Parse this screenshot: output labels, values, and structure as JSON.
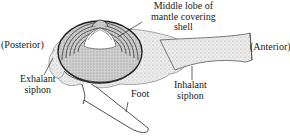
{
  "diagram": {
    "labels": {
      "middle_lobe_line1": "Middle lobe of",
      "middle_lobe_line2": "mantle covering",
      "middle_lobe_line3": "shell",
      "posterior": "(Posterior)",
      "anterior": "(Anterior)",
      "exhalant_line1": "Exhalant",
      "exhalant_line2": "siphon",
      "inhalant_line1": "Inhalant",
      "inhalant_line2": "siphon",
      "foot": "Foot"
    },
    "colors": {
      "line": "#2a2a2a",
      "stipple": "#bdbdbd",
      "shell_fill": "#d6d6d6",
      "background": "#ffffff"
    }
  }
}
